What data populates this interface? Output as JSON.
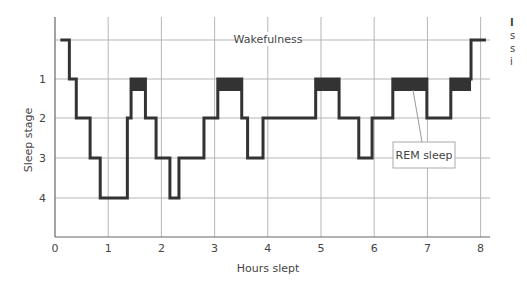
{
  "chart_data": {
    "type": "line",
    "subtype": "step hypnogram",
    "title": "",
    "xlabel": "Hours slept",
    "ylabel": "Sleep stage",
    "xlim": [
      0,
      8.3
    ],
    "x_ticks": [
      "0",
      "1",
      "2",
      "3",
      "4",
      "5",
      "6",
      "7",
      "8"
    ],
    "y_ticks": [
      "1",
      "2",
      "3",
      "4"
    ],
    "y_levels": {
      "wake": 0,
      "stage1_REM": 1,
      "stage2": 2,
      "stage3": 3,
      "stage4": 4
    },
    "grid": true,
    "annotations": [
      {
        "text": "Wakefulness",
        "at": "wake line",
        "x": 3.4
      },
      {
        "text": "REM sleep",
        "points_to": {
          "x": 6.6,
          "level": 1
        }
      }
    ],
    "series": [
      {
        "name": "Sleep stage",
        "step_points": [
          {
            "t": 0.1,
            "stage": 0
          },
          {
            "t": 0.27,
            "stage": 1
          },
          {
            "t": 0.4,
            "stage": 2
          },
          {
            "t": 0.66,
            "stage": 3
          },
          {
            "t": 0.85,
            "stage": 4
          },
          {
            "t": 1.36,
            "stage": 2
          },
          {
            "t": 1.43,
            "stage": 1
          },
          {
            "t": 1.7,
            "stage": 2
          },
          {
            "t": 1.9,
            "stage": 3
          },
          {
            "t": 2.16,
            "stage": 4
          },
          {
            "t": 2.33,
            "stage": 3
          },
          {
            "t": 2.8,
            "stage": 2
          },
          {
            "t": 3.06,
            "stage": 1
          },
          {
            "t": 3.51,
            "stage": 2
          },
          {
            "t": 3.62,
            "stage": 3
          },
          {
            "t": 3.91,
            "stage": 2
          },
          {
            "t": 4.9,
            "stage": 1
          },
          {
            "t": 5.34,
            "stage": 2
          },
          {
            "t": 5.71,
            "stage": 3
          },
          {
            "t": 5.96,
            "stage": 2
          },
          {
            "t": 6.35,
            "stage": 1
          },
          {
            "t": 6.99,
            "stage": 2
          },
          {
            "t": 7.44,
            "stage": 1
          },
          {
            "t": 7.82,
            "stage": 0
          },
          {
            "t": 8.1,
            "stage": 0
          }
        ]
      }
    ],
    "rem_periods": [
      {
        "start": 1.43,
        "end": 1.7
      },
      {
        "start": 3.06,
        "end": 3.51
      },
      {
        "start": 4.9,
        "end": 5.34
      },
      {
        "start": 6.35,
        "end": 6.99
      },
      {
        "start": 7.44,
        "end": 7.82
      }
    ],
    "colors": {
      "line": "#333333",
      "rem_fill": "#333333",
      "grid": "#b5b5b5",
      "axis": "#666666"
    }
  },
  "side_text_fragments": [
    "I",
    "s",
    "s",
    "i"
  ]
}
